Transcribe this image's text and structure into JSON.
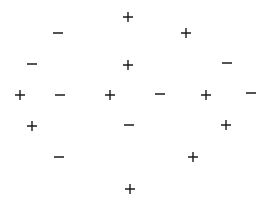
{
  "diagram": {
    "type": "scatter-of-signs",
    "background": "#ffffff",
    "symbol_color": "#1a1a1a",
    "symbols": [
      {
        "sign": "+",
        "x": 128,
        "y": 17
      },
      {
        "sign": "-",
        "x": 58,
        "y": 33
      },
      {
        "sign": "+",
        "x": 186,
        "y": 33
      },
      {
        "sign": "-",
        "x": 32,
        "y": 64
      },
      {
        "sign": "+",
        "x": 128,
        "y": 65
      },
      {
        "sign": "-",
        "x": 227,
        "y": 63
      },
      {
        "sign": "+",
        "x": 20,
        "y": 95
      },
      {
        "sign": "-",
        "x": 60,
        "y": 95
      },
      {
        "sign": "+",
        "x": 110,
        "y": 95
      },
      {
        "sign": "-",
        "x": 160,
        "y": 94
      },
      {
        "sign": "+",
        "x": 206,
        "y": 95
      },
      {
        "sign": "-",
        "x": 251,
        "y": 93
      },
      {
        "sign": "+",
        "x": 32,
        "y": 126
      },
      {
        "sign": "-",
        "x": 129,
        "y": 125
      },
      {
        "sign": "+",
        "x": 226,
        "y": 125
      },
      {
        "sign": "-",
        "x": 59,
        "y": 157
      },
      {
        "sign": "+",
        "x": 193,
        "y": 157
      },
      {
        "sign": "+",
        "x": 130,
        "y": 189
      }
    ]
  }
}
